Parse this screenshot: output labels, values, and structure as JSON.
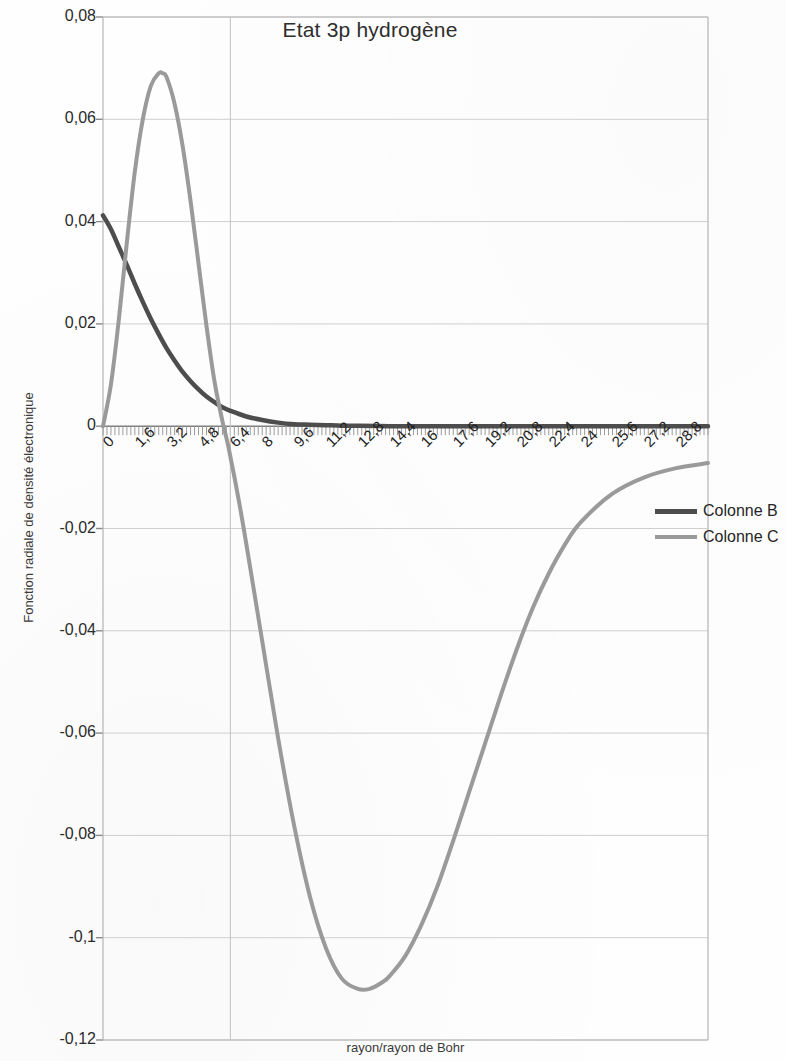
{
  "chart_data": {
    "type": "line",
    "title": "Etat 3p hydrogène",
    "xlabel": "rayon/rayon de Bohr",
    "ylabel": "Fonction radiale de densité électronique",
    "grid": true,
    "legend_position": "right",
    "xlim": [
      0,
      30.4
    ],
    "ylim": [
      -0.12,
      0.08
    ],
    "x_tick_labels": [
      "0",
      "1,6",
      "3,2",
      "4,8",
      "6,4",
      "8",
      "9,6",
      "11,2",
      "12,8",
      "14,4",
      "16",
      "17,6",
      "19,2",
      "20,8",
      "22,4",
      "24",
      "25,6",
      "27,2",
      "28,8"
    ],
    "x_tick_values": [
      0,
      1.6,
      3.2,
      4.8,
      6.4,
      8,
      9.6,
      11.2,
      12.8,
      14.4,
      16,
      17.6,
      19.2,
      20.8,
      22.4,
      24,
      25.6,
      27.2,
      28.8
    ],
    "y_tick_labels": [
      "0,08",
      "0,06",
      "0,04",
      "0,02",
      "0",
      "-0,02",
      "-0,04",
      "-0,06",
      "-0,08",
      "-0,1",
      "-0,12"
    ],
    "y_tick_values": [
      0.08,
      0.06,
      0.04,
      0.02,
      0,
      -0.02,
      -0.04,
      -0.06,
      -0.08,
      -0.1,
      -0.12
    ],
    "series": [
      {
        "name": "Colonne B",
        "color": "#4d4d4d",
        "width": 4.5,
        "x": [
          0,
          0.4,
          0.8,
          1.2,
          1.6,
          2.0,
          2.4,
          2.8,
          3.2,
          3.6,
          4.0,
          4.4,
          4.8,
          5.2,
          5.6,
          6.0,
          6.4,
          7.2,
          8.0,
          8.8,
          9.6,
          10.4,
          11.2,
          12.0,
          12.8,
          14.4,
          16.0,
          17.6,
          19.2,
          20.8,
          22.4,
          24.0,
          25.6,
          27.2,
          28.8,
          30.4
        ],
        "y": [
          0.0412,
          0.0385,
          0.035,
          0.0315,
          0.0278,
          0.0243,
          0.021,
          0.018,
          0.0152,
          0.0128,
          0.0106,
          0.0088,
          0.0072,
          0.0058,
          0.0047,
          0.0037,
          0.003,
          0.0019,
          0.0012,
          0.0007,
          0.0004,
          0.0003,
          0.0002,
          0.0001,
          0.0001,
          0.0,
          0.0,
          0.0,
          0.0,
          0.0,
          0.0,
          0.0,
          0.0,
          0.0,
          0.0,
          0.0
        ]
      },
      {
        "name": "Colonne C",
        "color": "#9a9a9a",
        "width": 4.0,
        "x": [
          0,
          0.4,
          0.8,
          1.2,
          1.6,
          2.0,
          2.4,
          2.8,
          3.0,
          3.2,
          3.6,
          4.0,
          4.4,
          4.8,
          5.2,
          5.6,
          6.0,
          6.3,
          6.8,
          7.2,
          8.0,
          8.8,
          9.6,
          10.4,
          11.2,
          12.0,
          12.8,
          13.4,
          14.0,
          14.4,
          15.2,
          16.0,
          16.8,
          17.6,
          18.4,
          19.2,
          20.0,
          20.8,
          21.6,
          22.4,
          23.2,
          24.0,
          25.6,
          27.2,
          28.8,
          30.4
        ],
        "y": [
          0.0,
          0.0082,
          0.021,
          0.036,
          0.0498,
          0.06,
          0.0665,
          0.069,
          0.069,
          0.0682,
          0.063,
          0.0548,
          0.044,
          0.0318,
          0.0196,
          0.0088,
          0.001,
          -0.004,
          -0.014,
          -0.023,
          -0.042,
          -0.061,
          -0.078,
          -0.092,
          -0.102,
          -0.108,
          -0.11,
          -0.11,
          -0.1088,
          -0.1075,
          -0.1035,
          -0.0975,
          -0.09,
          -0.081,
          -0.0715,
          -0.062,
          -0.0525,
          -0.0435,
          -0.0355,
          -0.0288,
          -0.0232,
          -0.0188,
          -0.0132,
          -0.01,
          -0.0082,
          -0.0072
        ]
      }
    ]
  },
  "legend": {
    "items": [
      {
        "label": "Colonne B"
      },
      {
        "label": "Colonne C"
      }
    ]
  }
}
